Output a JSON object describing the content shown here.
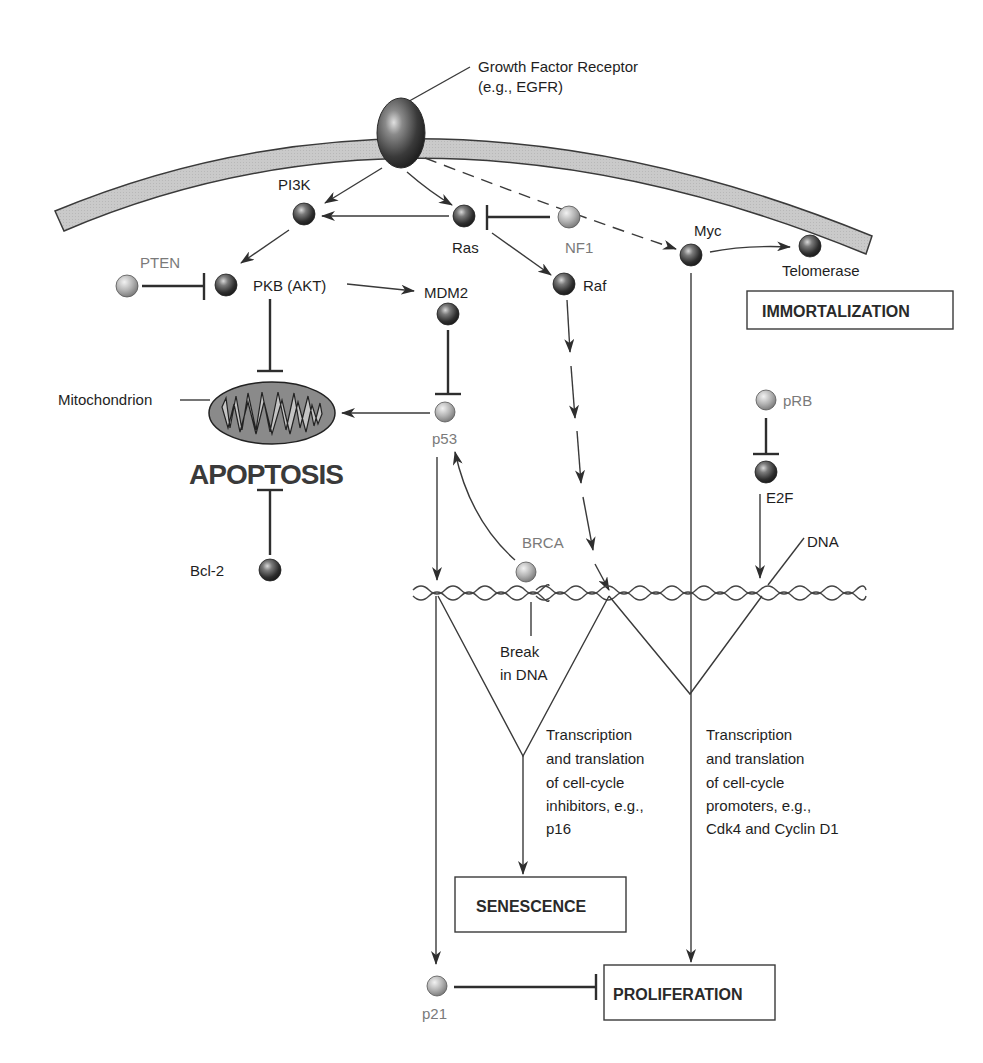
{
  "diagram": {
    "type": "signaling pathway",
    "receptor": {
      "label_line1": "Growth Factor Receptor",
      "label_line2": "(e.g., EGFR)"
    },
    "nodes": {
      "pi3k": "PI3K",
      "ras": "Ras",
      "nf1": "NF1",
      "myc": "Myc",
      "telomerase": "Telomerase",
      "pten": "PTEN",
      "pkb": "PKB (AKT)",
      "mdm2": "MDM2",
      "raf": "Raf",
      "mitochondrion": "Mitochondrion",
      "p53": "p53",
      "prb": "pRB",
      "e2f": "E2F",
      "bcl2": "Bcl-2",
      "brca": "BRCA",
      "dna": "DNA",
      "p21": "p21"
    },
    "annotations": {
      "apoptosis": "APOPTOSIS",
      "break_line1": "Break",
      "break_line2": "in DNA",
      "inhibitors": [
        "Transcription",
        "and translation",
        "of cell-cycle",
        "inhibitors, e.g.,",
        "p16"
      ],
      "promoters": [
        "Transcription",
        "and translation",
        "of cell-cycle",
        "promoters, e.g.,",
        "Cdk4 and Cyclin D1"
      ]
    },
    "outcomes": {
      "immortalization": "IMMORTALIZATION",
      "senescence": "SENESCENCE",
      "proliferation": "PROLIFERATION"
    },
    "colors": {
      "membrane_fill": "#c8c8c8",
      "membrane_edge": "#3a3a3a",
      "dark_node": "#3c3c3c",
      "light_node": "#b0b0b0",
      "line": "#3a3a3a",
      "grey_label": "#7a7a7a"
    }
  }
}
